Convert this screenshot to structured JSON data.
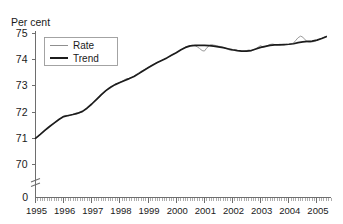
{
  "chart_data": {
    "type": "line",
    "title": "",
    "subtitle": "",
    "unit_label": "Per cent",
    "xlabel": "",
    "ylabel": "Per cent",
    "ylim": [
      70,
      75
    ],
    "y_ticks": [
      70,
      71,
      72,
      73,
      74,
      75
    ],
    "y_zero_tick": "0",
    "axis_break": true,
    "grid": false,
    "legend_position": "top-left",
    "x_tick_labels": [
      "1995",
      "1996",
      "1997",
      "1998",
      "1999",
      "2000",
      "2001",
      "2002",
      "2003",
      "2004",
      "2005"
    ],
    "x_minor_ticks_per_year": 12,
    "xlim": [
      1995.0,
      2005.5
    ],
    "series": [
      {
        "name": "Rate",
        "color": "#8f8f8f",
        "width": 0.9,
        "x": [
          1995.0,
          1995.08,
          1995.17,
          1995.25,
          1995.33,
          1995.42,
          1995.5,
          1995.58,
          1995.67,
          1995.75,
          1995.83,
          1995.92,
          1996.0,
          1996.08,
          1996.17,
          1996.25,
          1996.33,
          1996.42,
          1996.5,
          1996.58,
          1996.67,
          1996.75,
          1996.83,
          1996.92,
          1997.0,
          1997.08,
          1997.17,
          1997.25,
          1997.33,
          1997.42,
          1997.5,
          1997.58,
          1997.67,
          1997.75,
          1997.83,
          1997.92,
          1998.0,
          1998.08,
          1998.17,
          1998.25,
          1998.33,
          1998.42,
          1998.5,
          1998.58,
          1998.67,
          1998.75,
          1998.83,
          1998.92,
          1999.0,
          1999.08,
          1999.17,
          1999.25,
          1999.33,
          1999.42,
          1999.5,
          1999.58,
          1999.67,
          1999.75,
          1999.83,
          1999.92,
          2000.0,
          2000.08,
          2000.17,
          2000.25,
          2000.33,
          2000.42,
          2000.5,
          2000.58,
          2000.67,
          2000.75,
          2000.83,
          2000.92,
          2001.0,
          2001.08,
          2001.17,
          2001.25,
          2001.33,
          2001.42,
          2001.5,
          2001.58,
          2001.67,
          2001.75,
          2001.83,
          2001.92,
          2002.0,
          2002.08,
          2002.17,
          2002.25,
          2002.33,
          2002.42,
          2002.5,
          2002.58,
          2002.67,
          2002.75,
          2002.83,
          2002.92,
          2003.0,
          2003.08,
          2003.17,
          2003.25,
          2003.33,
          2003.42,
          2003.5,
          2003.58,
          2003.67,
          2003.75,
          2003.83,
          2003.92,
          2004.0,
          2004.08,
          2004.17,
          2004.25,
          2004.33,
          2004.42,
          2004.5,
          2004.58,
          2004.67,
          2004.75,
          2004.83,
          2004.92,
          2005.0,
          2005.08,
          2005.17,
          2005.25,
          2005.33
        ],
        "y": [
          70.98,
          71.05,
          71.12,
          71.2,
          71.27,
          71.34,
          71.42,
          71.49,
          71.56,
          71.62,
          71.69,
          71.76,
          71.82,
          71.86,
          71.84,
          71.86,
          71.9,
          71.89,
          71.92,
          71.96,
          72.0,
          72.07,
          72.14,
          72.2,
          72.28,
          72.38,
          72.46,
          72.52,
          72.62,
          72.71,
          72.8,
          72.88,
          72.95,
          73.0,
          73.04,
          73.08,
          73.12,
          73.16,
          73.22,
          73.26,
          73.26,
          73.3,
          73.36,
          73.42,
          73.48,
          73.54,
          73.58,
          73.63,
          73.68,
          73.74,
          73.79,
          73.84,
          73.88,
          73.92,
          73.96,
          74.01,
          74.06,
          74.1,
          74.15,
          74.2,
          74.25,
          74.3,
          74.36,
          74.42,
          74.46,
          74.5,
          74.52,
          74.53,
          74.51,
          74.47,
          74.41,
          74.33,
          74.31,
          74.42,
          74.52,
          74.56,
          74.54,
          74.52,
          74.5,
          74.48,
          74.45,
          74.42,
          74.38,
          74.34,
          74.33,
          74.36,
          74.34,
          74.32,
          74.3,
          74.31,
          74.33,
          74.35,
          74.34,
          74.36,
          74.4,
          74.47,
          74.52,
          74.46,
          74.48,
          74.52,
          74.56,
          74.58,
          74.56,
          74.55,
          74.57,
          74.56,
          74.55,
          74.57,
          74.56,
          74.58,
          74.62,
          74.72,
          74.82,
          74.88,
          74.84,
          74.74,
          74.66,
          74.64,
          74.66,
          74.68,
          74.72,
          74.76,
          74.8,
          74.84,
          74.88
        ]
      },
      {
        "name": "Trend",
        "color": "#1c1c1c",
        "width": 1.7,
        "x": [
          1995.0,
          1995.17,
          1995.33,
          1995.5,
          1995.67,
          1995.83,
          1996.0,
          1996.17,
          1996.33,
          1996.5,
          1996.67,
          1996.83,
          1997.0,
          1997.17,
          1997.33,
          1997.5,
          1997.67,
          1997.83,
          1998.0,
          1998.17,
          1998.33,
          1998.5,
          1998.67,
          1998.83,
          1999.0,
          1999.17,
          1999.33,
          1999.5,
          1999.67,
          1999.83,
          2000.0,
          2000.17,
          2000.33,
          2000.5,
          2000.67,
          2000.83,
          2001.0,
          2001.17,
          2001.33,
          2001.5,
          2001.67,
          2001.83,
          2002.0,
          2002.17,
          2002.33,
          2002.5,
          2002.67,
          2002.83,
          2003.0,
          2003.17,
          2003.33,
          2003.5,
          2003.67,
          2003.83,
          2004.0,
          2004.17,
          2004.33,
          2004.5,
          2004.67,
          2004.83,
          2005.0,
          2005.17,
          2005.33
        ],
        "y": [
          70.98,
          71.13,
          71.28,
          71.43,
          71.57,
          71.7,
          71.81,
          71.85,
          71.89,
          71.94,
          72.01,
          72.13,
          72.29,
          72.47,
          72.64,
          72.8,
          72.93,
          73.03,
          73.11,
          73.19,
          73.26,
          73.34,
          73.45,
          73.56,
          73.67,
          73.78,
          73.87,
          73.96,
          74.05,
          74.15,
          74.25,
          74.36,
          74.45,
          74.51,
          74.53,
          74.53,
          74.53,
          74.52,
          74.5,
          74.47,
          74.44,
          74.4,
          74.36,
          74.33,
          74.31,
          74.31,
          74.33,
          74.39,
          74.45,
          74.49,
          74.53,
          74.55,
          74.55,
          74.56,
          74.57,
          74.59,
          74.63,
          74.66,
          74.68,
          74.69,
          74.73,
          74.79,
          74.86
        ]
      }
    ]
  },
  "legend": {
    "items": [
      {
        "label": "Rate"
      },
      {
        "label": "Trend"
      }
    ]
  }
}
